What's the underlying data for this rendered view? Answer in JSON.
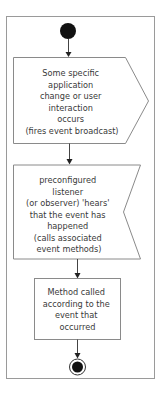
{
  "diagram": {
    "type": "activity",
    "colors": {
      "frame": "#9a9a9a",
      "node_stroke": "#8a8a8a",
      "text": "#3a3a3a",
      "initial_node": "#111111",
      "final_node": "#111111"
    },
    "nodes": [
      {
        "id": "start",
        "kind": "initial"
      },
      {
        "id": "send_signal",
        "kind": "send-signal",
        "lines": [
          "Some specific",
          "application",
          "change or user",
          "interaction",
          "occurs",
          "(fires event broadcast)"
        ]
      },
      {
        "id": "accept_event",
        "kind": "accept-event",
        "lines": [
          "preconfigured",
          "listener",
          "(or observer) 'hears'",
          "that the event has",
          "happened",
          "(calls associated",
          "event methods)"
        ]
      },
      {
        "id": "action",
        "kind": "action",
        "lines": [
          "Method called",
          "according to the",
          "event that",
          "occurred"
        ]
      },
      {
        "id": "end",
        "kind": "final"
      }
    ],
    "edges": [
      {
        "from": "start",
        "to": "send_signal"
      },
      {
        "from": "send_signal",
        "to": "accept_event"
      },
      {
        "from": "accept_event",
        "to": "action"
      },
      {
        "from": "action",
        "to": "end"
      }
    ]
  }
}
